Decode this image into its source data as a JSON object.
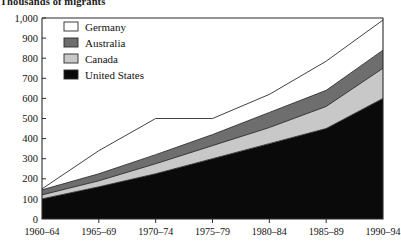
{
  "chart_data": {
    "type": "area",
    "stacked": true,
    "title": "Thousands of migrants",
    "xlabel": "",
    "ylabel": "",
    "categories": [
      "1960–64",
      "1965–69",
      "1970–74",
      "1975–79",
      "1980–84",
      "1985–89",
      "1990–94"
    ],
    "x_tick_labels": [
      "1960–64",
      "1965–69",
      "1970–74",
      "1975–79",
      "1980–84",
      "1985–89",
      "1990–94"
    ],
    "y_tick_labels": [
      "1,000",
      "900",
      "800",
      "700",
      "600",
      "500",
      "400",
      "300",
      "200",
      "100",
      "0"
    ],
    "y_ticks": [
      1000,
      900,
      800,
      700,
      600,
      500,
      400,
      300,
      200,
      100,
      0
    ],
    "ylim": [
      0,
      1000
    ],
    "grid": false,
    "legend_position": "top-left",
    "series": [
      {
        "name": "United States",
        "color": "#0a0a0a",
        "order": 1,
        "values": [
          100,
          160,
          225,
          300,
          375,
          450,
          600
        ]
      },
      {
        "name": "Canada",
        "color": "#c8c8c8",
        "order": 2,
        "values": [
          20,
          30,
          50,
          65,
          80,
          110,
          150
        ]
      },
      {
        "name": "Australia",
        "color": "#6e6e6e",
        "order": 3,
        "values": [
          25,
          35,
          45,
          55,
          75,
          80,
          90
        ]
      },
      {
        "name": "Germany",
        "color": "#ffffff",
        "order": 4,
        "values": [
          5,
          115,
          180,
          80,
          90,
          145,
          150
        ]
      }
    ],
    "cumulative_tops": {
      "united_states": [
        100,
        160,
        225,
        300,
        375,
        450,
        600
      ],
      "canada": [
        120,
        190,
        275,
        365,
        455,
        560,
        750
      ],
      "australia": [
        145,
        225,
        320,
        420,
        530,
        640,
        840
      ],
      "germany": [
        150,
        340,
        500,
        500,
        620,
        785,
        990
      ]
    }
  },
  "legend": {
    "items": [
      {
        "label": "Germany",
        "color": "#ffffff"
      },
      {
        "label": "Australia",
        "color": "#6e6e6e"
      },
      {
        "label": "Canada",
        "color": "#c8c8c8"
      },
      {
        "label": "United States",
        "color": "#0a0a0a"
      }
    ]
  }
}
